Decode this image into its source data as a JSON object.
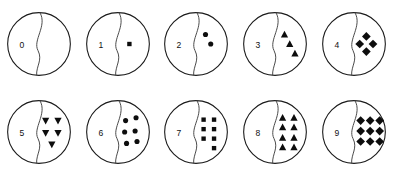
{
  "figure": {
    "background_color": "#ffffff",
    "outline_color": "#1a1a1a",
    "divider_color": "#4a4a4a",
    "token_color": "#0d0d0d",
    "rows": 2,
    "columns": 5
  },
  "cards": [
    {
      "digit": "0",
      "count": 0,
      "token_shape": "none",
      "token_layout": "empty",
      "row": 1,
      "column": 1
    },
    {
      "digit": "1",
      "count": 1,
      "token_shape": "square",
      "token_layout": "single-center",
      "row": 1,
      "column": 2
    },
    {
      "digit": "2",
      "count": 2,
      "token_shape": "circle",
      "token_layout": "diagonal-descending",
      "row": 1,
      "column": 3
    },
    {
      "digit": "3",
      "count": 3,
      "token_shape": "triangle-up",
      "token_layout": "diagonal-descending",
      "row": 1,
      "column": 4
    },
    {
      "digit": "4",
      "count": 4,
      "token_shape": "diamond",
      "token_layout": "diamond-cluster",
      "row": 1,
      "column": 5
    },
    {
      "digit": "5",
      "count": 5,
      "token_shape": "triangle-down",
      "token_layout": "quincunx",
      "row": 2,
      "column": 1
    },
    {
      "digit": "6",
      "count": 6,
      "token_shape": "circle",
      "token_layout": "two-by-three-offset",
      "row": 2,
      "column": 2
    },
    {
      "digit": "7",
      "count": 7,
      "token_shape": "square",
      "token_layout": "three-by-two-plus-one",
      "row": 2,
      "column": 3
    },
    {
      "digit": "8",
      "count": 8,
      "token_shape": "triangle-up",
      "token_layout": "two-by-four",
      "row": 2,
      "column": 4
    },
    {
      "digit": "9",
      "count": 9,
      "token_shape": "diamond",
      "token_layout": "three-by-three",
      "row": 2,
      "column": 5
    }
  ]
}
